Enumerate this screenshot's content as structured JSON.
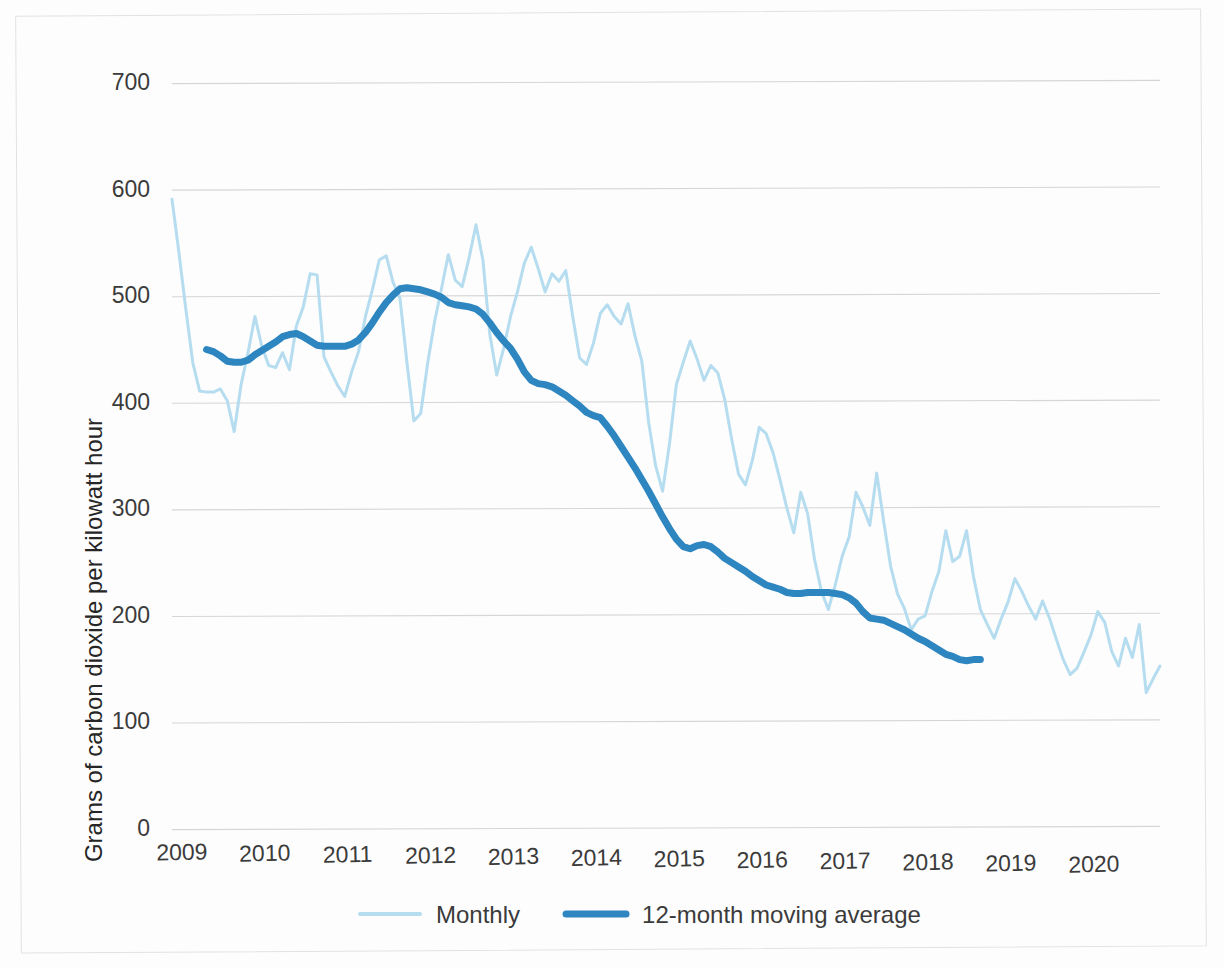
{
  "chart_data": {
    "type": "line",
    "title": "",
    "xlabel": "",
    "ylabel": "Grams of carbon dioxide per kilowatt hour",
    "ylim": [
      0,
      700
    ],
    "yticks": [
      0,
      100,
      200,
      300,
      400,
      500,
      600,
      700
    ],
    "xticks": [
      "2009",
      "2010",
      "2011",
      "2012",
      "2013",
      "2014",
      "2015",
      "2016",
      "2017",
      "2018",
      "2019",
      "2020"
    ],
    "xlim": [
      "2009-01",
      "2020-11"
    ],
    "grid": true,
    "legend_position": "bottom",
    "colors": {
      "monthly": "#b5ddef",
      "moving_average": "#2e86c1",
      "gridline": "#d6d6d6",
      "text": "#3b3b3b"
    },
    "series": [
      {
        "name": "Monthly",
        "color": "#b5ddef",
        "line_width": 3,
        "values": [
          590,
          540,
          487,
          437,
          410,
          409,
          409,
          412,
          401,
          372,
          416,
          446,
          480,
          452,
          434,
          432,
          446,
          430,
          471,
          489,
          520,
          519,
          442,
          428,
          415,
          405,
          428,
          447,
          480,
          505,
          533,
          537,
          512,
          497,
          437,
          382,
          389,
          436,
          475,
          506,
          538,
          514,
          508,
          535,
          566,
          533,
          463,
          425,
          450,
          480,
          503,
          530,
          545,
          525,
          503,
          520,
          513,
          523,
          480,
          441,
          435,
          455,
          483,
          491,
          480,
          473,
          492,
          462,
          438,
          380,
          340,
          316,
          360,
          416,
          437,
          457,
          440,
          420,
          434,
          427,
          402,
          365,
          332,
          322,
          345,
          376,
          370,
          352,
          327,
          300,
          277,
          315,
          295,
          252,
          222,
          205,
          228,
          255,
          273,
          315,
          301,
          284,
          333,
          288,
          246,
          220,
          206,
          186,
          196,
          199,
          222,
          241,
          279,
          250,
          255,
          279,
          236,
          205,
          191,
          178,
          196,
          212,
          234,
          222,
          208,
          196,
          213,
          197,
          177,
          158,
          144,
          150,
          165,
          181,
          203,
          193,
          166,
          152,
          178,
          160,
          191,
          127,
          140,
          152
        ]
      },
      {
        "name": "12-month moving average",
        "color": "#2e86c1",
        "line_width": 7,
        "values": [
          449,
          447,
          443,
          438,
          437,
          437,
          439,
          444,
          448,
          452,
          456,
          461,
          463,
          464,
          461,
          457,
          453,
          452,
          452,
          452,
          452,
          454,
          458,
          465,
          474,
          484,
          493,
          500,
          506,
          507,
          506,
          505,
          503,
          501,
          498,
          493,
          491,
          490,
          489,
          487,
          482,
          474,
          465,
          457,
          450,
          440,
          428,
          420,
          417,
          416,
          414,
          410,
          406,
          401,
          396,
          390,
          387,
          385,
          377,
          368,
          358,
          348,
          338,
          327,
          316,
          304,
          292,
          281,
          271,
          264,
          262,
          265,
          266,
          264,
          259,
          253,
          249,
          245,
          241,
          236,
          232,
          228,
          226,
          224,
          221,
          220,
          220,
          221,
          221,
          221,
          221,
          220,
          219,
          216,
          211,
          203,
          197,
          196,
          195,
          192,
          189,
          186,
          182,
          178,
          175,
          171,
          167,
          163,
          161,
          158,
          157,
          158,
          158
        ],
        "offset_months": 5
      }
    ]
  },
  "legend": {
    "items": [
      {
        "label": "Monthly",
        "color": "#b5ddef"
      },
      {
        "label": "12-month moving average",
        "color": "#2e86c1"
      }
    ]
  },
  "axes": {
    "y_title": "Grams of carbon dioxide per kilowatt hour",
    "y_labels": [
      "700",
      "600",
      "500",
      "400",
      "300",
      "200",
      "100",
      "0"
    ],
    "x_labels": [
      "2009",
      "2010",
      "2011",
      "2012",
      "2013",
      "2014",
      "2015",
      "2016",
      "2017",
      "2018",
      "2019",
      "2020"
    ]
  }
}
